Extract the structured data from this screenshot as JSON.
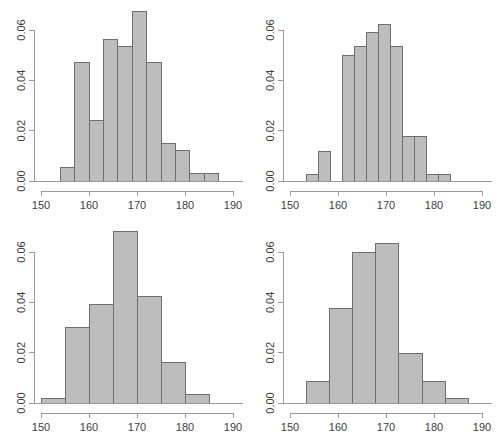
{
  "figure": {
    "title": "",
    "background_color": "#ffffff",
    "bar_fill_color": "#bdbdbd",
    "bar_border_color": "#6e6e6e",
    "axis_color": "#9a9a9a",
    "label_color": "#3d3d3d",
    "layout": "2x2 grid of histograms"
  },
  "chart_data": [
    {
      "type": "bar",
      "panel": "top-left",
      "title": "",
      "xlabel": "",
      "ylabel": "",
      "xlim": [
        150,
        190
      ],
      "ylim": [
        0,
        0.07
      ],
      "grid": false,
      "legend": null,
      "xticks": [
        150,
        160,
        170,
        180,
        190
      ],
      "xtick_labels": [
        "150",
        "160",
        "170",
        "180",
        "190"
      ],
      "yticks": [
        0.0,
        0.02,
        0.04,
        0.06
      ],
      "ytick_labels": [
        "0.00",
        "0.02",
        "0.04",
        "0.06"
      ],
      "bin_edges": [
        154,
        157,
        160,
        163,
        166,
        169,
        172,
        175,
        178,
        181,
        184,
        187
      ],
      "bin_width": 3,
      "values": [
        0.0055,
        0.047,
        0.024,
        0.0562,
        0.0533,
        0.0672,
        0.047,
        0.015,
        0.012,
        0.0028,
        0.0028
      ]
    },
    {
      "type": "bar",
      "panel": "top-right",
      "title": "",
      "xlabel": "",
      "ylabel": "",
      "xlim": [
        150,
        190
      ],
      "ylim": [
        0,
        0.07
      ],
      "grid": false,
      "legend": null,
      "xticks": [
        150,
        160,
        170,
        180,
        190
      ],
      "xtick_labels": [
        "150",
        "160",
        "170",
        "180",
        "190"
      ],
      "yticks": [
        0.0,
        0.02,
        0.04,
        0.06
      ],
      "ytick_labels": [
        "0.00",
        "0.02",
        "0.04",
        "0.06"
      ],
      "bin_edges": [
        153.5,
        156.0,
        158.5,
        161.0,
        163.5,
        166.0,
        168.5,
        171.0,
        173.5,
        176.0,
        178.5,
        181.0,
        183.5,
        186.0
      ],
      "bin_width": 2.5,
      "values": [
        0.0027,
        0.0118,
        0.0,
        0.05,
        0.0533,
        0.059,
        0.0622,
        0.0533,
        0.0175,
        0.0175,
        0.0027,
        0.0027,
        0.0
      ]
    },
    {
      "type": "bar",
      "panel": "bottom-left",
      "title": "",
      "xlabel": "",
      "ylabel": "",
      "xlim": [
        150,
        190
      ],
      "ylim": [
        0,
        0.07
      ],
      "grid": false,
      "legend": null,
      "xticks": [
        150,
        160,
        170,
        180,
        190
      ],
      "xtick_labels": [
        "150",
        "160",
        "170",
        "180",
        "190"
      ],
      "yticks": [
        0.0,
        0.02,
        0.04,
        0.06
      ],
      "ytick_labels": [
        "0.00",
        "0.02",
        "0.04",
        "0.06"
      ],
      "bin_edges": [
        150,
        155,
        160,
        165,
        170,
        175,
        180,
        185
      ],
      "bin_width": 5,
      "values": [
        0.0017,
        0.0302,
        0.0392,
        0.068,
        0.0423,
        0.016,
        0.0032
      ]
    },
    {
      "type": "bar",
      "panel": "bottom-right",
      "title": "",
      "xlabel": "",
      "ylabel": "",
      "xlim": [
        150,
        190
      ],
      "ylim": [
        0,
        0.07
      ],
      "grid": false,
      "legend": null,
      "xticks": [
        150,
        160,
        170,
        180,
        190
      ],
      "xtick_labels": [
        "150",
        "160",
        "170",
        "180",
        "190"
      ],
      "yticks": [
        0.0,
        0.02,
        0.04,
        0.06
      ],
      "ytick_labels": [
        "0.00",
        "0.02",
        "0.04",
        "0.06"
      ],
      "bin_edges": [
        153.5,
        158.3,
        163.1,
        167.9,
        172.7,
        177.5,
        182.3,
        187.1
      ],
      "bin_width": 4.8,
      "values": [
        0.0085,
        0.0375,
        0.06,
        0.0635,
        0.0195,
        0.0085,
        0.0017
      ]
    }
  ]
}
